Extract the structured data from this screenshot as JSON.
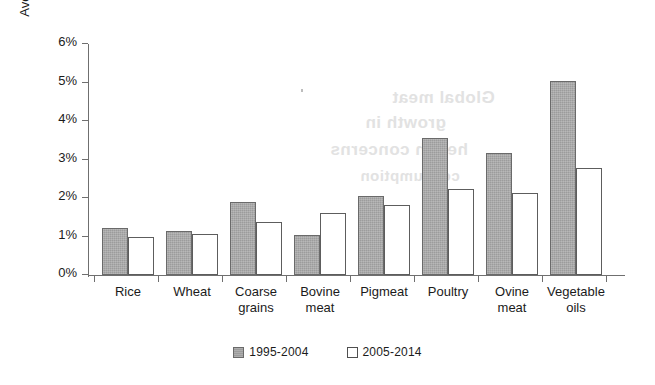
{
  "chart_data": {
    "type": "bar",
    "title": "",
    "xlabel": "",
    "ylabel": "Average annual growth",
    "categories": [
      "Rice",
      "Wheat",
      "Coarse grains",
      "Bovine meat",
      "Pigmeat",
      "Poultry",
      "Ovine meat",
      "Vegetable oils"
    ],
    "category_lines": [
      [
        "Rice"
      ],
      [
        "Wheat"
      ],
      [
        "Coarse",
        "grains"
      ],
      [
        "Bovine",
        "meat"
      ],
      [
        "Pigmeat"
      ],
      [
        "Poultry"
      ],
      [
        "Ovine",
        "meat"
      ],
      [
        "Vegetable",
        "oils"
      ]
    ],
    "series": [
      {
        "name": "1995-2004",
        "color": "#9c9c9c",
        "values": [
          1.22,
          1.15,
          1.9,
          1.03,
          2.04,
          3.55,
          3.16,
          5.05
        ]
      },
      {
        "name": "2005-2014",
        "color": "#ffffff",
        "values": [
          0.98,
          1.07,
          1.37,
          1.62,
          1.81,
          2.23,
          2.12,
          2.78
        ]
      }
    ],
    "ylim": [
      0,
      6
    ],
    "y_ticks": [
      0,
      1,
      2,
      3,
      4,
      5,
      6
    ],
    "y_tick_labels": [
      "0%",
      "1%",
      "2%",
      "3%",
      "4%",
      "5%",
      "6%"
    ],
    "value_unit": "%",
    "grid": false,
    "legend_position": "bottom-center"
  },
  "legend": {
    "items": [
      {
        "label": "1995-2004",
        "swatch": "filled-gray-square"
      },
      {
        "label": "2005-2014",
        "swatch": "outline-white-square"
      }
    ]
  },
  "background_bleed": {
    "lines": [
      {
        "text": "Global meat",
        "x": 392,
        "y": 88,
        "size": 17
      },
      {
        "text": "growth in",
        "x": 365,
        "y": 113,
        "size": 17
      },
      {
        "text": "health concerns",
        "x": 330,
        "y": 140,
        "size": 17
      },
      {
        "text": "consumption",
        "x": 360,
        "y": 167,
        "size": 15
      }
    ]
  }
}
